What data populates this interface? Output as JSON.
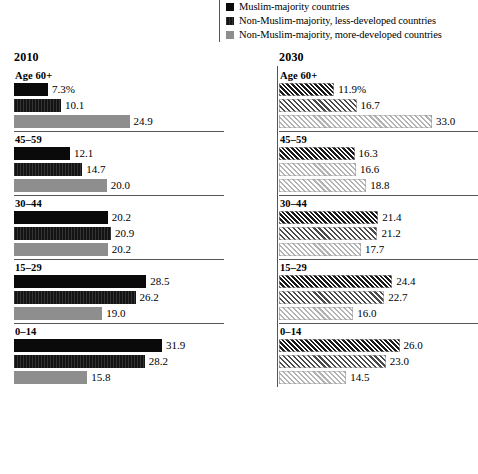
{
  "legend": {
    "items": [
      {
        "label": "Muslim-majority countries",
        "swatch_color": "#0a0a0a",
        "icon": "square-swatch-icon"
      },
      {
        "label": "Non-Muslim-majority, less-developed countries",
        "swatch_color": "#262626",
        "icon": "square-swatch-icon"
      },
      {
        "label": "Non-Muslim-majority, more-developed countries",
        "swatch_color": "#8e8e8e",
        "icon": "square-swatch-icon"
      }
    ]
  },
  "panels": [
    {
      "title": "2010",
      "groups": [
        {
          "label": "Age 60+",
          "values": [
            "7.3%",
            "10.1",
            "24.9"
          ]
        },
        {
          "label": "45–59",
          "values": [
            "12.1",
            "14.7",
            "20.0"
          ]
        },
        {
          "label": "30–44",
          "values": [
            "20.2",
            "20.9",
            "20.2"
          ]
        },
        {
          "label": "15–29",
          "values": [
            "28.5",
            "26.2",
            "19.0"
          ]
        },
        {
          "label": "0–14",
          "values": [
            "31.9",
            "28.2",
            "15.8"
          ]
        }
      ]
    },
    {
      "title": "2030",
      "groups": [
        {
          "label": "Age 60+",
          "values": [
            "11.9%",
            "16.7",
            "33.0"
          ]
        },
        {
          "label": "45–59",
          "values": [
            "16.3",
            "16.6",
            "18.8"
          ]
        },
        {
          "label": "30–44",
          "values": [
            "21.4",
            "21.2",
            "17.7"
          ]
        },
        {
          "label": "15–29",
          "values": [
            "24.4",
            "22.7",
            "16.0"
          ]
        },
        {
          "label": "0–14",
          "values": [
            "26.0",
            "23.0",
            "14.5"
          ]
        }
      ]
    }
  ],
  "chart_data": {
    "type": "bar",
    "orientation": "horizontal",
    "title": "",
    "xlabel": "",
    "ylabel": "",
    "grid": false,
    "legend_position": "top-right",
    "xlim": [
      0,
      33
    ],
    "px_per_unit": 4.64,
    "categories": [
      "Age 60+",
      "45–59",
      "30–44",
      "15–29",
      "0–14"
    ],
    "panels": [
      {
        "name": "2010",
        "series": [
          {
            "name": "Muslim-majority countries",
            "values": [
              7.3,
              12.1,
              20.2,
              28.5,
              31.9
            ]
          },
          {
            "name": "Non-Muslim-majority, less-developed countries",
            "values": [
              10.1,
              14.7,
              20.9,
              26.2,
              28.2
            ]
          },
          {
            "name": "Non-Muslim-majority, more-developed countries",
            "values": [
              24.9,
              20.0,
              20.2,
              19.0,
              15.8
            ]
          }
        ]
      },
      {
        "name": "2030",
        "series": [
          {
            "name": "Muslim-majority countries",
            "values": [
              11.9,
              16.3,
              21.4,
              24.4,
              26.0
            ]
          },
          {
            "name": "Non-Muslim-majority, less-developed countries",
            "values": [
              16.7,
              16.6,
              21.2,
              22.7,
              23.0
            ]
          },
          {
            "name": "Non-Muslim-majority, more-developed countries",
            "values": [
              33.0,
              18.8,
              17.7,
              16.0,
              14.5
            ]
          }
        ]
      }
    ],
    "units": "percent"
  }
}
